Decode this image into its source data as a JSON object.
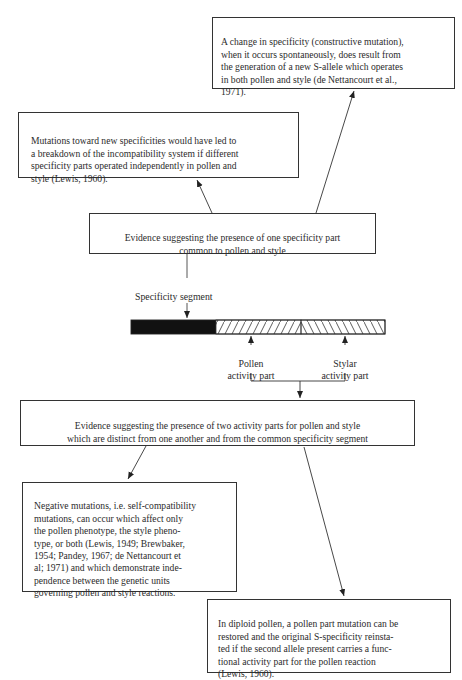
{
  "diagram": {
    "boxes": {
      "constructive_mutation": {
        "text": "A change in specificity (constructive mutation),\nwhen it occurs spontaneously, does result from\nthe generation of a new S-allele which operates\nin both pollen and style (de Nettancourt et al.,\n1971)."
      },
      "new_specificities": {
        "text": "Mutations toward  new  specificities would have led to\na breakdown of the incompatibility system if different\nspecificity parts operated independently in pollen and\nstyle (Lewis, 1960)."
      },
      "one_specificity_part": {
        "text": "Evidence suggesting the presence of one specificity part\ncommon to pollen and style"
      },
      "two_activity_parts": {
        "text": "Evidence suggesting the presence of two activity parts for pollen and style\nwhich are distinct from one another and from the common specificity segment"
      },
      "negative_mutations": {
        "text": "Negative mutations, i.e. self-compatibility\nmutations, can occur which affect only\nthe pollen phenotype, the style pheno-\ntype, or both (Lewis, 1949; Brewbaker,\n1954; Pandey, 1967; de Nettancourt et\nal; 1971) and which demonstrate inde-\npendence between the genetic units\ngoverning pollen and style reactions."
      },
      "diploid_pollen": {
        "text": "In diploid pollen, a pollen part mutation can be\nrestored and the original S-specificity reinsta-\nted if the second allele present carries a func-\ntional activity part for the pollen reaction\n(Lewis, 1960)."
      }
    },
    "gene_bar": {
      "segments": [
        {
          "name": "Specificity segment",
          "fill": "solid",
          "color": "#111111"
        },
        {
          "name": "Pollen activity part",
          "fill": "hatch-forward"
        },
        {
          "name": "Stylar activity part",
          "fill": "hatch-backward"
        }
      ],
      "labels": {
        "specificity": "Specificity segment",
        "pollen": "Pollen\nactivity part",
        "stylar": "Stylar\nactivity part"
      }
    },
    "colors": {
      "line": "#333333",
      "bar_solid": "#111111",
      "background": "#ffffff"
    }
  }
}
